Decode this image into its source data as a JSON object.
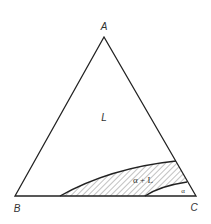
{
  "diagram": {
    "type": "ternary-phase-diagram",
    "vertices": {
      "top": "A",
      "bottom_left": "B",
      "bottom_right": "C"
    },
    "regions": [
      {
        "id": "liquid",
        "label": "L"
      },
      {
        "id": "two-phase",
        "label": "α + L",
        "fill": "hatched"
      },
      {
        "id": "solid",
        "label": "α"
      }
    ],
    "colors": {
      "line": "#222222",
      "hatch": "#555555",
      "text": "#333333",
      "background": "#ffffff"
    }
  }
}
